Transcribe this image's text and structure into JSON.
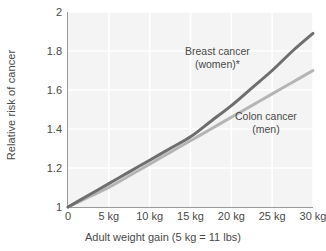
{
  "chart_data": {
    "type": "line",
    "title": "",
    "subtitle": "",
    "xlabel": "Adult weight gain (5 kg = 11 lbs)",
    "ylabel": "Relative risk of cancer",
    "xlim": [
      0,
      30
    ],
    "ylim": [
      1,
      2
    ],
    "grid": true,
    "legend_position": "inline-annotations",
    "x_tick_labels": [
      "0",
      "5 kg",
      "10 kg",
      "15 kg",
      "20 kg",
      "25 kg",
      "30 kg"
    ],
    "x_tick_values": [
      0,
      5,
      10,
      15,
      20,
      25,
      30
    ],
    "y_tick_labels": [
      "1",
      "1.2",
      "1.4",
      "1.6",
      "1.8",
      "2"
    ],
    "y_tick_values": [
      1,
      1.2,
      1.4,
      1.6,
      1.8,
      2
    ],
    "x": [
      0,
      2.5,
      5,
      7.5,
      10,
      12.5,
      15,
      17.5,
      20,
      22.5,
      25,
      27.5,
      30
    ],
    "series": [
      {
        "name": "Breast cancer (women)*",
        "label_line1": "Breast cancer",
        "label_line2": "(women)*",
        "color": "#6e6e6e",
        "values": [
          1.0,
          1.06,
          1.12,
          1.18,
          1.24,
          1.3,
          1.36,
          1.44,
          1.52,
          1.61,
          1.7,
          1.8,
          1.89
        ]
      },
      {
        "name": "Colon cancer (men)",
        "label_line1": "Colon cancer",
        "label_line2": "(men)",
        "color": "#b5b5b5",
        "values": [
          1.0,
          1.05,
          1.1,
          1.16,
          1.22,
          1.28,
          1.34,
          1.4,
          1.46,
          1.52,
          1.58,
          1.64,
          1.7
        ]
      }
    ],
    "colors": {
      "plot_background": "#f4f4f4",
      "gridline": "#ffffff",
      "axis": "#9a9a9a",
      "text": "#4a4a4a",
      "page_background": "#ffffff"
    }
  }
}
